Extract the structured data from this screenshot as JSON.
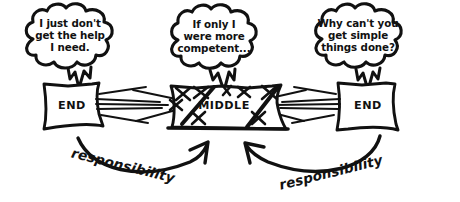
{
  "diagram": {
    "colors": {
      "ink": "#111111",
      "background": "#ffffff"
    },
    "thought_bubbles": [
      {
        "id": "left-bubble",
        "speaker_role": "end",
        "lines": [
          "I just don't",
          "get the help",
          "I need."
        ]
      },
      {
        "id": "middle-bubble",
        "speaker_role": "middle",
        "lines": [
          "If only I",
          "were more",
          "competent..."
        ]
      },
      {
        "id": "right-bubble",
        "speaker_role": "end",
        "lines": [
          "Why can't you",
          "get simple",
          "things done?"
        ]
      }
    ],
    "boxes": [
      {
        "id": "left-box",
        "label": "END"
      },
      {
        "id": "middle-box",
        "label": "MIDDLE"
      },
      {
        "id": "right-box",
        "label": "END"
      }
    ],
    "arrows": [
      {
        "id": "left-arrow",
        "label": "responsibility",
        "direction": "left-to-middle"
      },
      {
        "id": "right-arrow",
        "label": "responsibility",
        "direction": "right-to-middle"
      }
    ]
  }
}
